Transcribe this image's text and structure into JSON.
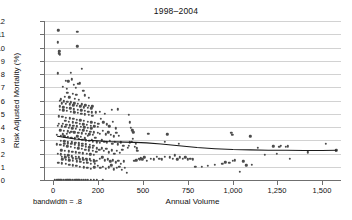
{
  "chart_data": {
    "type": "scatter",
    "title": "1998–2004",
    "xlabel": "Annual Volume",
    "ylabel": "Risk Adjusted Mortality (%)",
    "annotation": "bandwidth = .8",
    "grid": true,
    "legend": "none",
    "marker_color": "#4c4c4c",
    "fit_color": "#1a1a1a",
    "gridline_color": "#d2d2d2",
    "axis_color": "#6f6f6f",
    "ylim": [
      0,
      12
    ],
    "yticks": [
      0,
      1,
      2,
      3,
      4,
      5,
      6,
      7,
      8,
      9,
      10,
      11,
      12
    ],
    "ytick_labels": [
      "0",
      "1",
      "2",
      "3",
      "4",
      "5",
      "6",
      "7",
      "8",
      "9",
      "10",
      "11",
      "12"
    ],
    "xticks": [
      0,
      200,
      500,
      750,
      1000,
      1250,
      1500
    ],
    "xtick_labels": [
      "0",
      "200",
      "500",
      "750",
      "1,000",
      "1,250",
      "1,500"
    ],
    "xtick_positions_px": [
      53,
      98,
      143,
      188,
      233,
      277,
      322
    ],
    "xlim_px": [
      44,
      341
    ],
    "fit_line": {
      "name": "lowess smoother",
      "x": [
        20,
        60,
        100,
        150,
        200,
        260,
        320,
        380,
        450,
        520,
        600,
        700,
        800,
        900,
        1000,
        1100,
        1200,
        1300,
        1400,
        1500,
        1580
      ],
      "y": [
        3.3,
        3.2,
        3.1,
        3.0,
        2.95,
        2.9,
        2.88,
        2.86,
        2.84,
        2.8,
        2.72,
        2.58,
        2.45,
        2.36,
        2.3,
        2.27,
        2.25,
        2.24,
        2.23,
        2.23,
        2.24
      ]
    },
    "points": [
      [
        24,
        11.3
      ],
      [
        108,
        11.2
      ],
      [
        22,
        10.4
      ],
      [
        28,
        9.7
      ],
      [
        108,
        10.1
      ],
      [
        26,
        9.55
      ],
      [
        30,
        9.5
      ],
      [
        20,
        8.05
      ],
      [
        78,
        8.1
      ],
      [
        128,
        8.4
      ],
      [
        56,
        7.5
      ],
      [
        68,
        7.45
      ],
      [
        84,
        7.6
      ],
      [
        92,
        7.2
      ],
      [
        112,
        7.25
      ],
      [
        44,
        7.05
      ],
      [
        60,
        6.9
      ],
      [
        100,
        6.95
      ],
      [
        120,
        7.3
      ],
      [
        134,
        6.75
      ],
      [
        64,
        6.6
      ],
      [
        88,
        6.5
      ],
      [
        104,
        6.45
      ],
      [
        52,
        6.3
      ],
      [
        72,
        6.25
      ],
      [
        96,
        6.15
      ],
      [
        116,
        6.05
      ],
      [
        140,
        6.4
      ],
      [
        160,
        6.2
      ],
      [
        36,
        6.1
      ],
      [
        40,
        5.8
      ],
      [
        58,
        5.75
      ],
      [
        74,
        5.7
      ],
      [
        90,
        5.65
      ],
      [
        106,
        5.6
      ],
      [
        122,
        5.55
      ],
      [
        138,
        5.5
      ],
      [
        154,
        5.45
      ],
      [
        170,
        5.4
      ],
      [
        30,
        5.3
      ],
      [
        46,
        5.25
      ],
      [
        62,
        5.2
      ],
      [
        78,
        5.15
      ],
      [
        94,
        5.1
      ],
      [
        110,
        5.05
      ],
      [
        126,
        5.0
      ],
      [
        142,
        4.95
      ],
      [
        158,
        4.9
      ],
      [
        174,
        4.85
      ],
      [
        190,
        5.1
      ],
      [
        210,
        5.15
      ],
      [
        244,
        5.0
      ],
      [
        292,
        5.3
      ],
      [
        330,
        5.35
      ],
      [
        26,
        4.8
      ],
      [
        42,
        4.75
      ],
      [
        58,
        4.7
      ],
      [
        74,
        4.65
      ],
      [
        90,
        4.6
      ],
      [
        106,
        4.55
      ],
      [
        122,
        4.5
      ],
      [
        138,
        4.45
      ],
      [
        154,
        4.4
      ],
      [
        170,
        4.35
      ],
      [
        186,
        4.3
      ],
      [
        202,
        4.25
      ],
      [
        218,
        4.6
      ],
      [
        236,
        4.35
      ],
      [
        258,
        4.2
      ],
      [
        276,
        4.05
      ],
      [
        300,
        4.4
      ],
      [
        318,
        3.9
      ],
      [
        22,
        4.1
      ],
      [
        38,
        4.05
      ],
      [
        54,
        4.0
      ],
      [
        70,
        3.95
      ],
      [
        86,
        3.9
      ],
      [
        102,
        3.85
      ],
      [
        118,
        3.8
      ],
      [
        134,
        3.75
      ],
      [
        150,
        3.7
      ],
      [
        166,
        3.65
      ],
      [
        182,
        3.6
      ],
      [
        198,
        3.55
      ],
      [
        214,
        3.5
      ],
      [
        232,
        3.7
      ],
      [
        250,
        3.45
      ],
      [
        268,
        3.6
      ],
      [
        286,
        3.4
      ],
      [
        304,
        3.3
      ],
      [
        322,
        3.55
      ],
      [
        340,
        3.35
      ],
      [
        18,
        3.4
      ],
      [
        34,
        3.35
      ],
      [
        50,
        3.3
      ],
      [
        66,
        3.25
      ],
      [
        82,
        3.2
      ],
      [
        98,
        3.15
      ],
      [
        114,
        3.1
      ],
      [
        130,
        3.05
      ],
      [
        146,
        3.0
      ],
      [
        162,
        2.95
      ],
      [
        178,
        2.9
      ],
      [
        194,
        2.85
      ],
      [
        210,
        2.8
      ],
      [
        226,
        3.0
      ],
      [
        242,
        2.9
      ],
      [
        260,
        2.85
      ],
      [
        278,
        2.95
      ],
      [
        296,
        2.75
      ],
      [
        314,
        2.9
      ],
      [
        332,
        2.7
      ],
      [
        350,
        2.85
      ],
      [
        368,
        2.6
      ],
      [
        16,
        2.7
      ],
      [
        32,
        2.65
      ],
      [
        48,
        2.6
      ],
      [
        64,
        2.55
      ],
      [
        80,
        2.5
      ],
      [
        96,
        2.45
      ],
      [
        112,
        2.4
      ],
      [
        128,
        2.35
      ],
      [
        144,
        2.3
      ],
      [
        160,
        2.25
      ],
      [
        176,
        2.2
      ],
      [
        192,
        2.15
      ],
      [
        208,
        2.3
      ],
      [
        224,
        2.4
      ],
      [
        240,
        2.2
      ],
      [
        256,
        2.35
      ],
      [
        272,
        2.1
      ],
      [
        290,
        2.25
      ],
      [
        308,
        2.0
      ],
      [
        326,
        2.2
      ],
      [
        344,
        2.05
      ],
      [
        362,
        2.3
      ],
      [
        20,
        2.0
      ],
      [
        36,
        1.95
      ],
      [
        52,
        1.9
      ],
      [
        68,
        1.85
      ],
      [
        84,
        1.8
      ],
      [
        100,
        1.75
      ],
      [
        116,
        1.7
      ],
      [
        132,
        1.65
      ],
      [
        148,
        1.6
      ],
      [
        164,
        1.55
      ],
      [
        180,
        1.5
      ],
      [
        196,
        1.45
      ],
      [
        212,
        1.6
      ],
      [
        228,
        1.7
      ],
      [
        246,
        1.5
      ],
      [
        264,
        1.55
      ],
      [
        282,
        1.4
      ],
      [
        300,
        1.5
      ],
      [
        318,
        1.35
      ],
      [
        336,
        1.45
      ],
      [
        354,
        1.2
      ],
      [
        372,
        1.4
      ],
      [
        24,
        1.3
      ],
      [
        40,
        1.25
      ],
      [
        56,
        1.2
      ],
      [
        72,
        1.15
      ],
      [
        88,
        1.1
      ],
      [
        104,
        1.05
      ],
      [
        120,
        1.0
      ],
      [
        136,
        0.95
      ],
      [
        152,
        0.9
      ],
      [
        168,
        0.85
      ],
      [
        184,
        0.95
      ],
      [
        200,
        1.05
      ],
      [
        216,
        0.9
      ],
      [
        234,
        1.0
      ],
      [
        252,
        0.85
      ],
      [
        270,
        0.95
      ],
      [
        288,
        1.1
      ],
      [
        306,
        0.8
      ],
      [
        324,
        0.9
      ],
      [
        342,
        1.0
      ],
      [
        360,
        0.75
      ],
      [
        378,
        0.9
      ],
      [
        392,
        0.55
      ],
      [
        44,
        3.45
      ],
      [
        60,
        3.5
      ],
      [
        76,
        3.55
      ],
      [
        92,
        3.6
      ],
      [
        108,
        3.3
      ],
      [
        124,
        3.25
      ],
      [
        140,
        3.15
      ],
      [
        156,
        3.35
      ],
      [
        172,
        3.05
      ],
      [
        188,
        3.2
      ],
      [
        50,
        2.75
      ],
      [
        66,
        2.78
      ],
      [
        82,
        2.72
      ],
      [
        98,
        2.68
      ],
      [
        114,
        2.62
      ],
      [
        130,
        2.58
      ],
      [
        146,
        2.52
      ],
      [
        162,
        2.48
      ],
      [
        178,
        2.42
      ],
      [
        194,
        2.38
      ],
      [
        55,
        4.45
      ],
      [
        71,
        4.4
      ],
      [
        87,
        4.35
      ],
      [
        103,
        4.3
      ],
      [
        119,
        4.25
      ],
      [
        135,
        4.2
      ],
      [
        151,
        4.15
      ],
      [
        167,
        4.1
      ],
      [
        183,
        4.05
      ],
      [
        199,
        4.0
      ],
      [
        29,
        5.55
      ],
      [
        45,
        5.5
      ],
      [
        61,
        5.45
      ],
      [
        77,
        5.4
      ],
      [
        93,
        5.35
      ],
      [
        109,
        5.3
      ],
      [
        125,
        5.25
      ],
      [
        141,
        5.2
      ],
      [
        157,
        5.15
      ],
      [
        173,
        5.1
      ],
      [
        33,
        3.75
      ],
      [
        49,
        3.72
      ],
      [
        65,
        3.68
      ],
      [
        81,
        3.64
      ],
      [
        97,
        3.6
      ],
      [
        113,
        3.56
      ],
      [
        129,
        3.52
      ],
      [
        145,
        3.48
      ],
      [
        161,
        3.44
      ],
      [
        177,
        3.4
      ],
      [
        37,
        2.25
      ],
      [
        53,
        2.22
      ],
      [
        69,
        2.18
      ],
      [
        85,
        2.14
      ],
      [
        101,
        2.1
      ],
      [
        117,
        2.06
      ],
      [
        133,
        2.02
      ],
      [
        149,
        1.98
      ],
      [
        165,
        1.94
      ],
      [
        181,
        1.9
      ],
      [
        41,
        1.55
      ],
      [
        57,
        1.52
      ],
      [
        73,
        1.48
      ],
      [
        89,
        1.44
      ],
      [
        105,
        1.4
      ],
      [
        121,
        1.36
      ],
      [
        137,
        1.32
      ],
      [
        153,
        1.28
      ],
      [
        169,
        1.24
      ],
      [
        185,
        1.2
      ],
      [
        27,
        4.25
      ],
      [
        43,
        4.22
      ],
      [
        59,
        4.18
      ],
      [
        75,
        4.14
      ],
      [
        91,
        4.1
      ],
      [
        107,
        4.06
      ],
      [
        123,
        4.02
      ],
      [
        139,
        3.98
      ],
      [
        155,
        3.94
      ],
      [
        171,
        3.9
      ],
      [
        31,
        6.0
      ],
      [
        47,
        5.95
      ],
      [
        63,
        5.9
      ],
      [
        79,
        5.85
      ],
      [
        95,
        5.8
      ],
      [
        111,
        5.75
      ],
      [
        127,
        5.7
      ],
      [
        143,
        5.65
      ],
      [
        159,
        5.6
      ],
      [
        175,
        5.55
      ],
      [
        35,
        2.95
      ],
      [
        51,
        2.92
      ],
      [
        67,
        2.88
      ],
      [
        83,
        2.84
      ],
      [
        99,
        2.8
      ],
      [
        115,
        2.76
      ],
      [
        131,
        2.72
      ],
      [
        147,
        2.68
      ],
      [
        163,
        2.64
      ],
      [
        179,
        2.6
      ],
      [
        39,
        1.75
      ],
      [
        55,
        1.72
      ],
      [
        71,
        1.68
      ],
      [
        87,
        1.64
      ],
      [
        103,
        1.6
      ],
      [
        119,
        1.56
      ],
      [
        135,
        1.52
      ],
      [
        151,
        1.48
      ],
      [
        167,
        1.44
      ],
      [
        183,
        1.4
      ],
      [
        406,
        4.9
      ],
      [
        414,
        4.35
      ],
      [
        420,
        3.95
      ],
      [
        428,
        3.75
      ],
      [
        436,
        3.6
      ],
      [
        450,
        2.75
      ],
      [
        462,
        2.2
      ],
      [
        470,
        1.6
      ],
      [
        478,
        1.55
      ],
      [
        442,
        1.45
      ],
      [
        456,
        1.5
      ],
      [
        486,
        1.65
      ],
      [
        496,
        1.55
      ],
      [
        508,
        1.7
      ],
      [
        520,
        1.45
      ],
      [
        398,
        2.45
      ],
      [
        404,
        2.6
      ],
      [
        412,
        2.85
      ],
      [
        424,
        2.9
      ],
      [
        434,
        3.1
      ],
      [
        446,
        2.5
      ],
      [
        458,
        2.4
      ],
      [
        530,
        3.5
      ],
      [
        545,
        1.6
      ],
      [
        560,
        1.55
      ],
      [
        575,
        1.75
      ],
      [
        590,
        1.6
      ],
      [
        605,
        1.55
      ],
      [
        620,
        1.75
      ],
      [
        636,
        3.45
      ],
      [
        650,
        1.7
      ],
      [
        664,
        1.6
      ],
      [
        678,
        1.85
      ],
      [
        690,
        1.55
      ],
      [
        706,
        1.7
      ],
      [
        720,
        1.6
      ],
      [
        736,
        1.7
      ],
      [
        748,
        1.55
      ],
      [
        762,
        1.6
      ],
      [
        776,
        1.55
      ],
      [
        790,
        1.0
      ],
      [
        828,
        1.0
      ],
      [
        940,
        1.2
      ],
      [
        958,
        1.35
      ],
      [
        980,
        1.3
      ],
      [
        990,
        3.55
      ],
      [
        996,
        3.4
      ],
      [
        1000,
        1.45
      ],
      [
        1010,
        1.5
      ],
      [
        1040,
        0.6
      ],
      [
        1058,
        1.4
      ],
      [
        1075,
        1.1
      ],
      [
        1098,
        3.3
      ],
      [
        1108,
        1.15
      ],
      [
        1140,
        2.45
      ],
      [
        1180,
        1.9
      ],
      [
        1230,
        2.55
      ],
      [
        1250,
        2.0
      ],
      [
        1262,
        2.5
      ],
      [
        1270,
        2.6
      ],
      [
        1300,
        2.5
      ],
      [
        1310,
        2.55
      ],
      [
        1320,
        1.6
      ],
      [
        1420,
        2.1
      ],
      [
        1520,
        2.75
      ],
      [
        1575,
        2.2
      ],
      [
        1580,
        2.25
      ],
      [
        8,
        0
      ],
      [
        16,
        0
      ],
      [
        24,
        0
      ],
      [
        32,
        0
      ],
      [
        40,
        0
      ],
      [
        48,
        0
      ],
      [
        56,
        0
      ],
      [
        64,
        0
      ],
      [
        72,
        0
      ],
      [
        80,
        0
      ],
      [
        88,
        0
      ],
      [
        96,
        0
      ],
      [
        104,
        0
      ],
      [
        112,
        0
      ],
      [
        120,
        0
      ],
      [
        128,
        0
      ],
      [
        136,
        0
      ],
      [
        146,
        0
      ],
      [
        156,
        0
      ],
      [
        168,
        0
      ],
      [
        180,
        0
      ],
      [
        196,
        0
      ],
      [
        232,
        0
      ],
      [
        620,
        2.9
      ],
      [
        700,
        2.75
      ],
      [
        860,
        1.05
      ],
      [
        900,
        1.15
      ]
    ]
  }
}
